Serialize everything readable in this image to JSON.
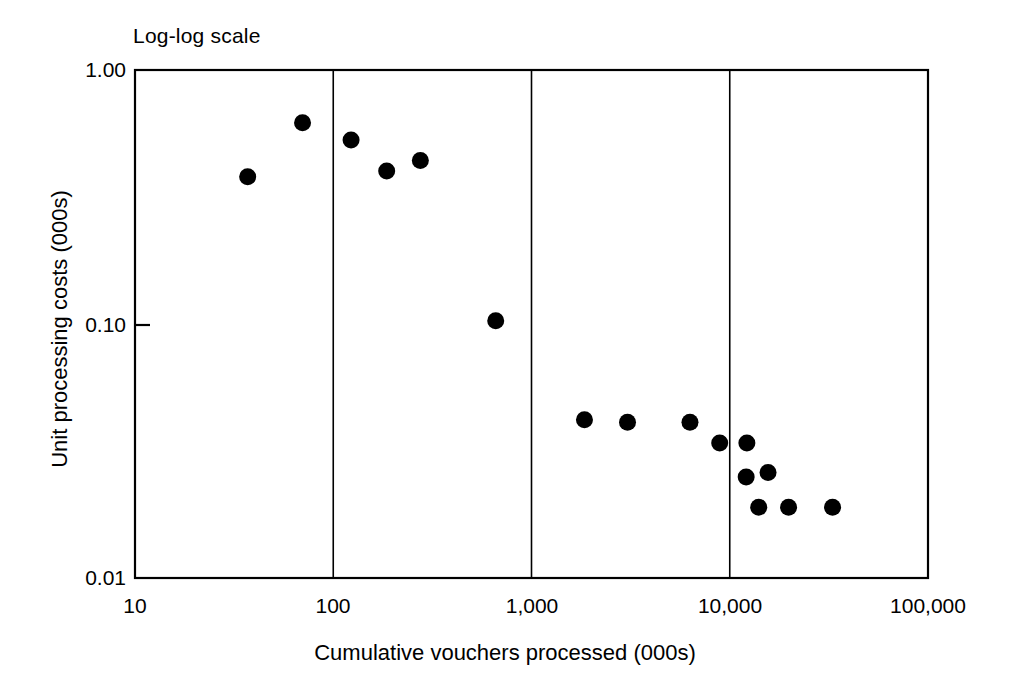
{
  "chart_data": {
    "type": "scatter",
    "title": "Log-log scale",
    "xlabel": "Cumulative vouchers processed (000s)",
    "ylabel": "Unit processing costs (000s)",
    "xscale": "log",
    "yscale": "log",
    "xlim": [
      10,
      100000
    ],
    "ylim": [
      0.01,
      1.0
    ],
    "xticks": [
      10,
      100,
      1000,
      10000,
      100000
    ],
    "xticklabels": [
      "10",
      "100",
      "1,000",
      "10,000",
      "100,000"
    ],
    "yticks": [
      0.01,
      0.1,
      1.0
    ],
    "yticklabels": [
      "0.01",
      "0.10",
      "1.00"
    ],
    "grid": "vertical gridlines at 100, 1,000 and 10,000",
    "legend": null,
    "marker": "filled-circle",
    "marker_color": "#000000",
    "points": [
      {
        "x": 37,
        "y": 0.38
      },
      {
        "x": 70,
        "y": 0.62
      },
      {
        "x": 123,
        "y": 0.53
      },
      {
        "x": 186,
        "y": 0.4
      },
      {
        "x": 275,
        "y": 0.44
      },
      {
        "x": 660,
        "y": 0.103
      },
      {
        "x": 1850,
        "y": 0.042
      },
      {
        "x": 3050,
        "y": 0.041
      },
      {
        "x": 6300,
        "y": 0.041
      },
      {
        "x": 8900,
        "y": 0.034
      },
      {
        "x": 12200,
        "y": 0.034
      },
      {
        "x": 12100,
        "y": 0.025
      },
      {
        "x": 15600,
        "y": 0.026
      },
      {
        "x": 14000,
        "y": 0.019
      },
      {
        "x": 19800,
        "y": 0.019
      },
      {
        "x": 33000,
        "y": 0.019
      }
    ]
  },
  "axes": {
    "title": "Log-log scale",
    "x_title": "Cumulative vouchers processed (000s)",
    "y_title": "Unit processing costs (000s)",
    "x_tick_labels": [
      "10",
      "100",
      "1,000",
      "10,000",
      "100,000"
    ],
    "y_tick_labels": [
      "1.00",
      "0.10",
      "0.01"
    ]
  },
  "style": {
    "axis_color": "#000000",
    "gridline_color": "#000000",
    "marker_color": "#000000",
    "background": "#ffffff"
  }
}
